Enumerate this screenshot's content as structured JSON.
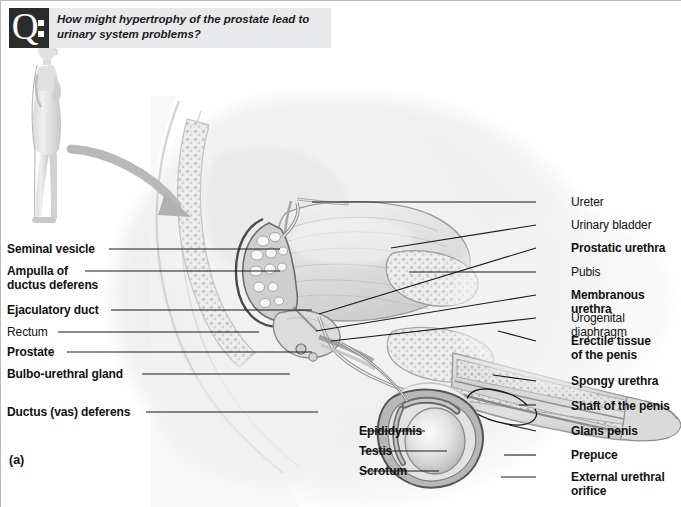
{
  "question": {
    "badge_letter": "Q",
    "badge_icon": "question-badge-icon",
    "text": "How might hypertrophy of the prostate lead to urinary system problems?"
  },
  "figure": {
    "letter": "(a)",
    "orientation_figure": "standing-male-lateral-view",
    "pointer_icon": "curved-arrow-icon",
    "illustration": "male-reproductive-system-midsagittal-section"
  },
  "labels_left": [
    {
      "id": "seminal-vesicle",
      "text": "Seminal vesicle",
      "bold": true,
      "x": 6,
      "y": 242,
      "line_x1": 108,
      "line_y1": 248,
      "line_x2": 279,
      "line_y2": 248
    },
    {
      "id": "ampulla-ductus-deferens",
      "text": "Ampulla of\nductus deferens",
      "bold": true,
      "x": 6,
      "y": 264,
      "line_x1": 84,
      "line_y1": 270,
      "line_x2": 279,
      "line_y2": 270
    },
    {
      "id": "ejaculatory-duct",
      "text": "Ejaculatory duct",
      "bold": true,
      "x": 6,
      "y": 303,
      "line_x1": 110,
      "line_y1": 309,
      "line_x2": 311,
      "line_y2": 309
    },
    {
      "id": "rectum",
      "text": "Rectum",
      "bold": false,
      "x": 6,
      "y": 325,
      "line_x1": 57,
      "line_y1": 331,
      "line_x2": 258,
      "line_y2": 331
    },
    {
      "id": "prostate",
      "text": "Prostate",
      "bold": true,
      "x": 6,
      "y": 345,
      "line_x1": 66,
      "line_y1": 351,
      "line_x2": 311,
      "line_y2": 351
    },
    {
      "id": "bulbo-urethral-gland",
      "text": "Bulbo-urethral gland",
      "bold": true,
      "x": 6,
      "y": 367,
      "line_x1": 141,
      "line_y1": 373,
      "line_x2": 289,
      "line_y2": 373
    },
    {
      "id": "ductus-vas-deferens",
      "text": "Ductus (vas) deferens",
      "bold": true,
      "x": 6,
      "y": 405,
      "line_x1": 145,
      "line_y1": 411,
      "line_x2": 317,
      "line_y2": 411
    }
  ],
  "labels_bottom": [
    {
      "id": "epididymis",
      "text": "Epididymis",
      "bold": true,
      "x": 358,
      "y": 424,
      "line_x1": 362,
      "line_y1": 430,
      "line_x2": 424,
      "line_y2": 430
    },
    {
      "id": "testis",
      "text": "Testis",
      "bold": true,
      "x": 358,
      "y": 444,
      "line_x1": 362,
      "line_y1": 450,
      "line_x2": 446,
      "line_y2": 450
    },
    {
      "id": "scrotum",
      "text": "Scrotum",
      "bold": true,
      "x": 358,
      "y": 464,
      "line_x1": 362,
      "line_y1": 470,
      "line_x2": 438,
      "line_y2": 470
    }
  ],
  "labels_right": [
    {
      "id": "ureter",
      "text": "Ureter",
      "bold": false,
      "x": 570,
      "y": 195,
      "line_x1": 535,
      "line_y1": 201,
      "line_x2": 311,
      "line_y2": 201
    },
    {
      "id": "urinary-bladder",
      "text": "Urinary bladder",
      "bold": false,
      "x": 570,
      "y": 218,
      "line_x1": 535,
      "line_y1": 224,
      "line_x2": 390,
      "line_y2": 247
    },
    {
      "id": "prostatic-urethra",
      "text": "Prostatic urethra",
      "bold": true,
      "x": 570,
      "y": 241,
      "line_x1": 535,
      "line_y1": 247,
      "line_x2": 318,
      "line_y2": 313
    },
    {
      "id": "pubis",
      "text": "Pubis",
      "bold": false,
      "x": 570,
      "y": 265,
      "line_x1": 535,
      "line_y1": 271,
      "line_x2": 408,
      "line_y2": 271
    },
    {
      "id": "membranous-urethra",
      "text": "Membranous urethra",
      "bold": true,
      "x": 570,
      "y": 288,
      "line_x1": 535,
      "line_y1": 294,
      "line_x2": 315,
      "line_y2": 330
    },
    {
      "id": "urogenital-diaphragm",
      "text": "Urogenital diaphragm",
      "bold": false,
      "x": 570,
      "y": 311,
      "line_x1": 535,
      "line_y1": 317,
      "line_x2": 330,
      "line_y2": 340
    },
    {
      "id": "erectile-tissue",
      "text": "Erectile tissue\nof the penis",
      "bold": true,
      "x": 570,
      "y": 334,
      "line_x1": 535,
      "line_y1": 340,
      "line_x2": 497,
      "line_y2": 330
    },
    {
      "id": "spongy-urethra",
      "text": "Spongy urethra",
      "bold": true,
      "x": 570,
      "y": 374,
      "line_x1": 535,
      "line_y1": 380,
      "line_x2": 492,
      "line_y2": 374
    },
    {
      "id": "shaft-of-the-penis",
      "text": "Shaft of the penis",
      "bold": true,
      "x": 570,
      "y": 399,
      "line_x1": 535,
      "line_y1": 404,
      "line_x2": 518,
      "line_y2": 404
    },
    {
      "id": "glans-penis",
      "text": "Glans penis",
      "bold": true,
      "x": 570,
      "y": 424,
      "line_x1": 535,
      "line_y1": 430,
      "line_x2": 508,
      "line_y2": 424
    },
    {
      "id": "prepuce",
      "text": "Prepuce",
      "bold": true,
      "x": 570,
      "y": 448,
      "line_x1": 535,
      "line_y1": 454,
      "line_x2": 503,
      "line_y2": 454
    },
    {
      "id": "external-urethral-orifice",
      "text": "External urethral\norifice",
      "bold": true,
      "x": 570,
      "y": 470,
      "line_x1": 535,
      "line_y1": 476,
      "line_x2": 500,
      "line_y2": 476
    }
  ],
  "colors": {
    "banner_bg": "#e8e9ea",
    "badge_bg": "#2b2b2b",
    "text": "#111111",
    "leader_line": "#1a1a1a",
    "border": "#b9b9b9"
  }
}
